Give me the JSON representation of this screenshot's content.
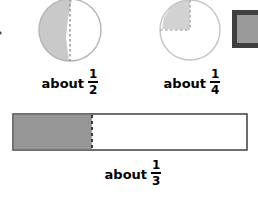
{
  "page": {
    "background_color": "#ffffff"
  },
  "decorations": {
    "left_chevron": {
      "icon": "chevron-right-icon",
      "color": "#4a4a4a"
    },
    "corner_box": {
      "icon": "square-icon",
      "fill_color": "#9a9a9a",
      "border_color": "#3f3f3f"
    }
  },
  "colors": {
    "circle_shade": "#c9c9c9",
    "circle_outline": "#b4b4b4",
    "bar_shade": "#969696",
    "bar_outline": "#4a4a4a",
    "dashed_line_circle": "#9a9a9a",
    "dashed_line_bar": "#3a3a3a",
    "text": "#000000"
  },
  "figures": [
    {
      "id": "circle-half",
      "shape": "circle",
      "shaded_fraction": 0.47,
      "guide": "vertical dashed diameter at center",
      "label": {
        "prefix": "about",
        "numerator": "1",
        "denominator": "2"
      }
    },
    {
      "id": "circle-quarter",
      "shape": "circle",
      "shaded_fraction": 0.24,
      "guide": "dashed radius up and dashed radius left marking the upper-left quadrant",
      "label": {
        "prefix": "about",
        "numerator": "1",
        "denominator": "4"
      }
    },
    {
      "id": "bar-third",
      "shape": "rectangle",
      "shaded_fraction": 0.34,
      "guide": "vertical dashed line at the one-third mark",
      "label": {
        "prefix": "about",
        "numerator": "1",
        "denominator": "3"
      }
    }
  ]
}
